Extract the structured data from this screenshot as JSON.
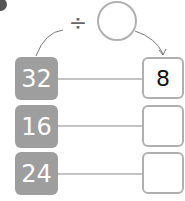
{
  "operator": {
    "symbol": "÷",
    "icon": "division-icon"
  },
  "divisor_circle": {
    "value": ""
  },
  "rows": [
    {
      "input": "32",
      "output": "8"
    },
    {
      "input": "16",
      "output": ""
    },
    {
      "input": "24",
      "output": ""
    }
  ],
  "colors": {
    "input_box": "#9e9e9e",
    "output_border": "#b0b0b0",
    "line": "#888888"
  }
}
